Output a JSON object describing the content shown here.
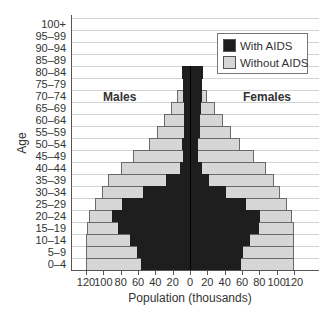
{
  "chart_data": {
    "type": "bar",
    "subtype": "population-pyramid",
    "title": "",
    "xlabel": "Population (thousands)",
    "ylabel": "Age",
    "xlim": [
      -120,
      120
    ],
    "x_ticks": [
      "120",
      "100",
      "80",
      "60",
      "40",
      "20",
      "0",
      "20",
      "40",
      "60",
      "80",
      "100",
      "120"
    ],
    "grid": true,
    "legend_position": "upper right",
    "legend": [
      {
        "name": "With AIDS",
        "color": "#1e1e1e"
      },
      {
        "name": "Without AIDS",
        "color": "#d6d6d6"
      }
    ],
    "annotations": [
      "Males",
      "Females"
    ],
    "categories": [
      "100+",
      "95–99",
      "90–94",
      "85–89",
      "80–84",
      "75–79",
      "70–74",
      "65–69",
      "60–64",
      "55–59",
      "50–54",
      "45–49",
      "40–44",
      "35–39",
      "30–34",
      "25–29",
      "20–24",
      "15–19",
      "10–14",
      "5–9",
      "0–4"
    ],
    "series": [
      {
        "name": "Males total",
        "values": [
          0,
          0,
          0,
          0,
          9,
          8,
          15,
          22,
          30,
          38,
          47,
          66,
          80,
          95,
          102,
          110,
          116,
          119,
          120,
          120,
          120
        ]
      },
      {
        "name": "Males with AIDS",
        "values": [
          0,
          0,
          0,
          0,
          9,
          8,
          8,
          7,
          7,
          7,
          9,
          8,
          12,
          28,
          54,
          78,
          90,
          83,
          69,
          61,
          57
        ]
      },
      {
        "name": "Females total",
        "values": [
          0,
          0,
          0,
          0,
          15,
          14,
          20,
          29,
          38,
          47,
          58,
          74,
          88,
          97,
          104,
          112,
          118,
          120,
          120,
          120,
          120
        ]
      },
      {
        "name": "Females with AIDS",
        "values": [
          0,
          0,
          0,
          0,
          15,
          14,
          14,
          13,
          12,
          12,
          9,
          9,
          14,
          22,
          41,
          65,
          81,
          80,
          69,
          61,
          59
        ]
      }
    ]
  },
  "labels": {
    "xlabel": "Population (thousands)",
    "ylabel": "Age",
    "males": "Males",
    "females": "Females",
    "legend_with": "With AIDS",
    "legend_without": "Without AIDS"
  }
}
